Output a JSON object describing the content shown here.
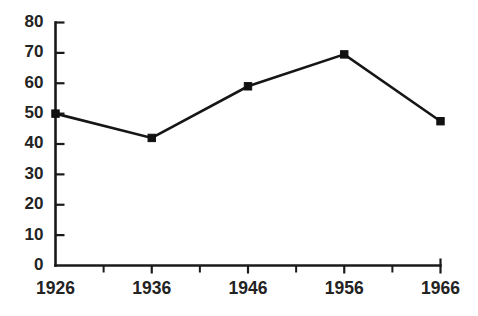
{
  "chart_data": {
    "type": "line",
    "title": "",
    "subtitle": "",
    "xlabel": "",
    "ylabel": "",
    "categories": [
      "1926",
      "1936",
      "1946",
      "1956",
      "1966"
    ],
    "x": [
      1926,
      1936,
      1946,
      1956,
      1966
    ],
    "values": [
      50,
      42,
      59,
      69.5,
      47.5
    ],
    "series": [
      {
        "name": "",
        "values": [
          50,
          42,
          59,
          69.5,
          47.5
        ]
      }
    ],
    "xlim": [
      1926,
      1966
    ],
    "ylim": [
      0,
      80
    ],
    "y_ticks": [
      0,
      10,
      20,
      30,
      40,
      50,
      60,
      70,
      80
    ],
    "y_tick_labels": [
      "0",
      "10",
      "20",
      "30",
      "40",
      "50",
      "60",
      "70",
      "80"
    ],
    "x_ticks": [
      1926,
      1936,
      1946,
      1956,
      1966
    ],
    "x_tick_labels": [
      "1926",
      "1936",
      "1946",
      "1956",
      "1966"
    ],
    "x_minor_ticks": [
      1931,
      1941,
      1951,
      1961
    ],
    "grid": false,
    "legend": false,
    "legend_position": "none",
    "marker": "square",
    "line_color": "#161616",
    "marker_color": "#111111",
    "axis_color": "#1a1a1a",
    "label_color": "#232323",
    "background_color": "#ffffff",
    "annotations": []
  }
}
